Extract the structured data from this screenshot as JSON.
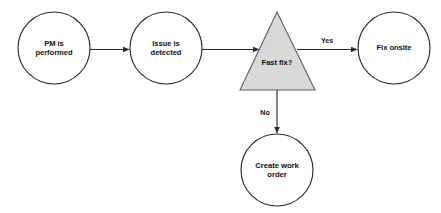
{
  "diagram": {
    "type": "flowchart",
    "background_color": "#ffffff",
    "node_fill_color": "#ffffff",
    "node_stroke_color": "#2b2b2b",
    "decision_fill_color": "#d9d9d9",
    "decision_stroke_color": "#5f5f5f",
    "text_color": "#111111",
    "nodes": [
      {
        "id": "pm-performed",
        "shape": "circle",
        "label": "PM is\nperformed",
        "cx": 54,
        "cy": 48,
        "r": 36
      },
      {
        "id": "issue-detected",
        "shape": "circle",
        "label": "Issue is\ndetected",
        "cx": 166,
        "cy": 48,
        "r": 36
      },
      {
        "id": "fast-fix-decision",
        "shape": "triangle",
        "label": "Fast fix?",
        "cx": 277,
        "cy": 52,
        "apex_y": 12,
        "base_y": 90,
        "base_left_x": 240,
        "base_right_x": 315
      },
      {
        "id": "fix-onsite",
        "shape": "circle",
        "label": "Fix onsite",
        "cx": 394,
        "cy": 48,
        "r": 36
      },
      {
        "id": "create-work-order",
        "shape": "circle",
        "label": "Create work\norder",
        "cx": 277,
        "cy": 170,
        "r": 36
      }
    ],
    "edges": [
      {
        "id": "edge-pm-to-issue",
        "from": "pm-performed",
        "to": "issue-detected",
        "label": "",
        "orientation": "horizontal"
      },
      {
        "id": "edge-issue-to-decision",
        "from": "issue-detected",
        "to": "fast-fix-decision",
        "label": "",
        "orientation": "horizontal"
      },
      {
        "id": "edge-decision-to-fix-onsite",
        "from": "fast-fix-decision",
        "to": "fix-onsite",
        "label": "Yes",
        "label_x": 327,
        "label_y": 41,
        "orientation": "horizontal"
      },
      {
        "id": "edge-decision-to-work-order",
        "from": "fast-fix-decision",
        "to": "create-work-order",
        "label": "No",
        "label_x": 265,
        "label_y": 113,
        "orientation": "vertical"
      }
    ]
  }
}
